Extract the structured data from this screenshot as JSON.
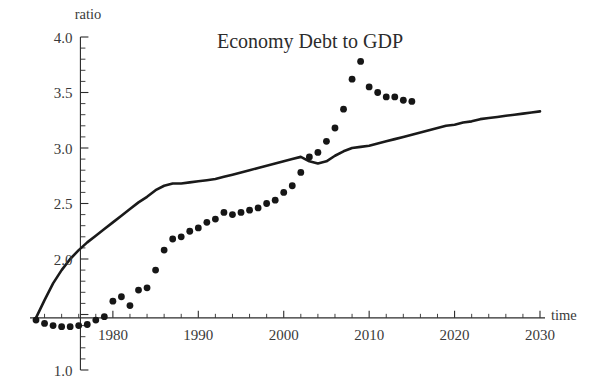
{
  "chart_data": {
    "type": "scatter",
    "title": "Economy Debt to GDP",
    "xlabel": "time",
    "ylabel": "ratio",
    "xlim": [
      1971,
      2030
    ],
    "ylim": [
      1.0,
      4.0
    ],
    "x_major_ticks": [
      1980,
      1990,
      2000,
      2010,
      2020,
      2030
    ],
    "x_tick_labels": [
      "1980",
      "1990",
      "2000",
      "2010",
      "2020",
      "2030"
    ],
    "x_minor_tick_step": 2,
    "y_major_ticks": [
      1.0,
      1.5,
      2.0,
      2.5,
      3.0,
      3.5,
      4.0
    ],
    "y_tick_labels": [
      "1.0",
      "1.5",
      "2.0",
      "2.5",
      "3.0",
      "3.5",
      "4.0"
    ],
    "y_labels_shown": [
      "1.0",
      "2.0",
      "2.5",
      "3.0",
      "3.5",
      "4.0"
    ],
    "y_minor_tick_step": 0.1,
    "grid": false,
    "legend": "none",
    "axis_origin_y": 1.47,
    "series": [
      {
        "name": "model",
        "style": "line",
        "color": "#1a1a1a",
        "x": [
          1971,
          1972,
          1973,
          1974,
          1975,
          1976,
          1977,
          1978,
          1979,
          1980,
          1981,
          1982,
          1983,
          1984,
          1985,
          1986,
          1987,
          1988,
          1989,
          1990,
          1991,
          1992,
          1993,
          1994,
          1995,
          1996,
          1997,
          1998,
          1999,
          2000,
          2001,
          2002,
          2003,
          2004,
          2005,
          2006,
          2007,
          2008,
          2009,
          2010,
          2011,
          2012,
          2013,
          2014,
          2015,
          2016,
          2017,
          2018,
          2019,
          2020,
          2021,
          2022,
          2023,
          2024,
          2025,
          2026,
          2027,
          2028,
          2029,
          2030
        ],
        "y": [
          1.47,
          1.63,
          1.78,
          1.9,
          2.0,
          2.08,
          2.15,
          2.21,
          2.27,
          2.33,
          2.39,
          2.45,
          2.51,
          2.56,
          2.62,
          2.66,
          2.68,
          2.68,
          2.69,
          2.7,
          2.71,
          2.72,
          2.74,
          2.76,
          2.78,
          2.8,
          2.82,
          2.84,
          2.86,
          2.88,
          2.9,
          2.92,
          2.88,
          2.86,
          2.88,
          2.93,
          2.97,
          3.0,
          3.01,
          3.02,
          3.04,
          3.06,
          3.08,
          3.1,
          3.12,
          3.14,
          3.16,
          3.18,
          3.2,
          3.21,
          3.23,
          3.24,
          3.26,
          3.27,
          3.28,
          3.29,
          3.3,
          3.31,
          3.32,
          3.33
        ]
      },
      {
        "name": "data",
        "style": "dots",
        "color": "#161616",
        "x": [
          1971,
          1972,
          1973,
          1974,
          1975,
          1976,
          1977,
          1978,
          1979,
          1980,
          1981,
          1982,
          1983,
          1984,
          1985,
          1986,
          1987,
          1988,
          1989,
          1990,
          1991,
          1992,
          1993,
          1994,
          1995,
          1996,
          1997,
          1998,
          1999,
          2000,
          2001,
          2002,
          2003,
          2004,
          2005,
          2006,
          2007,
          2008,
          2009,
          2010,
          2011,
          2012,
          2013,
          2014,
          2015
        ],
        "y": [
          1.45,
          1.42,
          1.4,
          1.39,
          1.39,
          1.4,
          1.41,
          1.45,
          1.48,
          1.62,
          1.66,
          1.58,
          1.72,
          1.74,
          1.9,
          2.08,
          2.18,
          2.2,
          2.25,
          2.28,
          2.33,
          2.36,
          2.42,
          2.4,
          2.42,
          2.44,
          2.46,
          2.5,
          2.53,
          2.6,
          2.66,
          2.78,
          2.92,
          2.96,
          3.06,
          3.18,
          3.35,
          3.62,
          3.78,
          3.55,
          3.5,
          3.46,
          3.46,
          3.43,
          3.42
        ]
      }
    ]
  }
}
